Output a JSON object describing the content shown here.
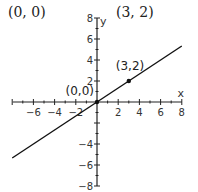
{
  "captions": {
    "left": "(0, 0)",
    "right": "(3, 2)"
  },
  "chart_data": {
    "type": "line",
    "title": "",
    "xlabel": "x",
    "ylabel": "y",
    "xlim": [
      -8,
      8
    ],
    "ylim": [
      -8,
      8
    ],
    "grid": false,
    "x_ticks": [
      -6,
      -4,
      -2,
      2,
      4,
      6,
      8
    ],
    "y_ticks": [
      -8,
      -6,
      -4,
      2,
      4,
      6,
      8
    ],
    "series": [
      {
        "name": "y = (2/3)x",
        "x": [
          -8,
          0,
          3,
          8
        ],
        "y": [
          -5.33,
          0,
          2,
          5.33
        ]
      }
    ],
    "points": [
      {
        "label": "(0,0)",
        "x": 0,
        "y": 0
      },
      {
        "label": "(3,2)",
        "x": 3,
        "y": 2
      }
    ]
  }
}
